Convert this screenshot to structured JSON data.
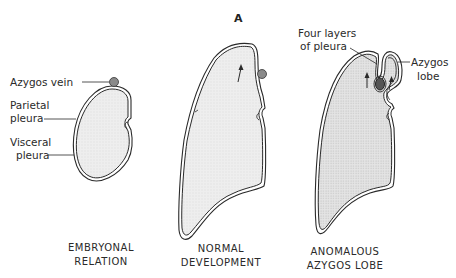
{
  "figure": {
    "panel_letter": "A",
    "panels": [
      {
        "id": "embryonal",
        "caption_line1": "EMBRYONAL",
        "caption_line2": "RELATION",
        "labels": {
          "azygos_vein": "Azygos vein",
          "parietal_line1": "Parietal",
          "parietal_line2": "pleura",
          "visceral_line1": "Visceral",
          "visceral_line2": "pleura"
        }
      },
      {
        "id": "normal",
        "caption_line1": "NORMAL",
        "caption_line2": "DEVELOPMENT"
      },
      {
        "id": "anomalous",
        "caption_line1": "ANOMALOUS",
        "caption_line2": "AZYGOS LOBE",
        "labels": {
          "four_layers_line1": "Four layers",
          "four_layers_line2": "of pleura",
          "azygos_lobe_line1": "Azygos",
          "azygos_lobe_line2": "lobe"
        }
      }
    ],
    "colors": {
      "line": "#2a2a2a",
      "lung_fill": "#ececec",
      "vein_fill": "#8a8a8a"
    }
  }
}
